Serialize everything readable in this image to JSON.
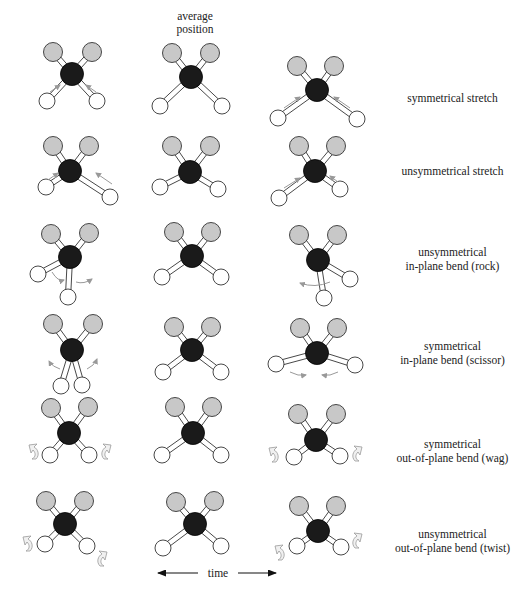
{
  "header": {
    "line1": "average",
    "line2": "position"
  },
  "time_axis": {
    "label": "time",
    "left_arrow": "left-arrow",
    "right_arrow": "right-arrow"
  },
  "colors": {
    "carbon": "#1a1a1a",
    "gray_atom": "#c8c8c8",
    "hydrogen": "#ffffff",
    "outline": "#333333",
    "motion_arrow": "#999999"
  },
  "rows": [
    {
      "label_lines": [
        "symmetrical stretch"
      ]
    },
    {
      "label_lines": [
        "unsymmetrical stretch"
      ]
    },
    {
      "label_lines": [
        "unsymmetrical",
        "in-plane bend (rock)"
      ]
    },
    {
      "label_lines": [
        "symmetrical",
        "in-plane bend (scissor)"
      ]
    },
    {
      "label_lines": [
        "symmetrical",
        "out-of-plane bend (wag)"
      ]
    },
    {
      "label_lines": [
        "unsymmetrical",
        "out-of-plane bend (twist)"
      ]
    }
  ],
  "molecules": [
    {
      "row": 0,
      "col": 0,
      "c": [
        72,
        74
      ],
      "g": [
        [
          53,
          52
        ],
        [
          92,
          52
        ]
      ],
      "h": [
        [
          47,
          101
        ],
        [
          97,
          101
        ]
      ],
      "arrows": "stretch-in"
    },
    {
      "row": 0,
      "col": 1,
      "c": [
        191,
        77
      ],
      "g": [
        [
          172,
          53
        ],
        [
          210,
          53
        ]
      ],
      "h": [
        [
          160,
          106
        ],
        [
          222,
          106
        ]
      ],
      "arrows": "none"
    },
    {
      "row": 0,
      "col": 2,
      "c": [
        317,
        90
      ],
      "g": [
        [
          297,
          66
        ],
        [
          334,
          66
        ]
      ],
      "h": [
        [
          278,
          118
        ],
        [
          357,
          119
        ]
      ],
      "arrows": "stretch-out"
    },
    {
      "row": 1,
      "col": 0,
      "c": [
        70,
        171
      ],
      "g": [
        [
          53,
          146
        ],
        [
          89,
          146
        ]
      ],
      "h": [
        [
          46,
          187
        ],
        [
          110,
          197
        ]
      ],
      "arrows": "unsym-a"
    },
    {
      "row": 1,
      "col": 1,
      "c": [
        190,
        172
      ],
      "g": [
        [
          172,
          146
        ],
        [
          210,
          146
        ]
      ],
      "h": [
        [
          160,
          187
        ],
        [
          218,
          189
        ]
      ],
      "arrows": "none"
    },
    {
      "row": 1,
      "col": 2,
      "c": [
        315,
        171
      ],
      "g": [
        [
          299,
          146
        ],
        [
          336,
          146
        ]
      ],
      "h": [
        [
          279,
          198
        ],
        [
          340,
          189
        ]
      ],
      "arrows": "unsym-b"
    },
    {
      "row": 2,
      "col": 0,
      "c": [
        70,
        257
      ],
      "g": [
        [
          51,
          234
        ],
        [
          89,
          233
        ]
      ],
      "h": [
        [
          38,
          274
        ],
        [
          68,
          297
        ]
      ],
      "arrows": "rock-a"
    },
    {
      "row": 2,
      "col": 1,
      "c": [
        192,
        256
      ],
      "g": [
        [
          174,
          232
        ],
        [
          211,
          232
        ]
      ],
      "h": [
        [
          162,
          277
        ],
        [
          221,
          277
        ]
      ],
      "arrows": "none"
    },
    {
      "row": 2,
      "col": 2,
      "c": [
        318,
        260
      ],
      "g": [
        [
          299,
          235
        ],
        [
          337,
          235
        ]
      ],
      "h": [
        [
          350,
          279
        ],
        [
          324,
          298
        ]
      ],
      "arrows": "rock-b"
    },
    {
      "row": 3,
      "col": 0,
      "c": [
        72,
        350
      ],
      "g": [
        [
          53,
          324
        ],
        [
          93,
          324
        ]
      ],
      "h": [
        [
          61,
          386
        ],
        [
          82,
          385
        ]
      ],
      "arrows": "scissor-a"
    },
    {
      "row": 3,
      "col": 1,
      "c": [
        192,
        350
      ],
      "g": [
        [
          174,
          327
        ],
        [
          211,
          327
        ]
      ],
      "h": [
        [
          163,
          372
        ],
        [
          221,
          372
        ]
      ],
      "arrows": "none"
    },
    {
      "row": 3,
      "col": 2,
      "c": [
        317,
        353
      ],
      "g": [
        [
          300,
          328
        ],
        [
          337,
          328
        ]
      ],
      "h": [
        [
          276,
          364
        ],
        [
          355,
          365
        ]
      ],
      "arrows": "scissor-b"
    },
    {
      "row": 4,
      "col": 0,
      "c": [
        69,
        433
      ],
      "g": [
        [
          51,
          408
        ],
        [
          88,
          407
        ]
      ],
      "h": [
        [
          50,
          455
        ],
        [
          89,
          455
        ]
      ],
      "arrows": "wag-a"
    },
    {
      "row": 4,
      "col": 1,
      "c": [
        193,
        433
      ],
      "g": [
        [
          175,
          407
        ],
        [
          212,
          407
        ]
      ],
      "h": [
        [
          162,
          455
        ],
        [
          221,
          455
        ]
      ],
      "arrows": "none"
    },
    {
      "row": 4,
      "col": 2,
      "c": [
        316,
        440
      ],
      "g": [
        [
          298,
          414
        ],
        [
          336,
          414
        ]
      ],
      "h": [
        [
          294,
          457
        ],
        [
          340,
          456
        ]
      ],
      "arrows": "wag-b"
    },
    {
      "row": 5,
      "col": 0,
      "c": [
        65,
        524
      ],
      "g": [
        [
          46,
          501
        ],
        [
          84,
          501
        ]
      ],
      "h": [
        [
          45,
          544
        ],
        [
          87,
          546
        ]
      ],
      "arrows": "twist-a"
    },
    {
      "row": 5,
      "col": 1,
      "c": [
        195,
        524
      ],
      "g": [
        [
          176,
          502
        ],
        [
          214,
          501
        ]
      ],
      "h": [
        [
          163,
          548
        ],
        [
          221,
          546
        ]
      ],
      "arrows": "none"
    },
    {
      "row": 5,
      "col": 2,
      "c": [
        318,
        531
      ],
      "g": [
        [
          299,
          506
        ],
        [
          336,
          506
        ]
      ],
      "h": [
        [
          297,
          546
        ],
        [
          341,
          547
        ]
      ],
      "arrows": "twist-b"
    }
  ]
}
